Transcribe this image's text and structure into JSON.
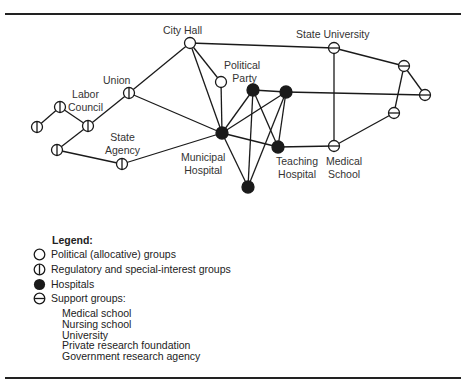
{
  "figure": {
    "nodes": [
      {
        "id": "city_hall",
        "label": "City Hall",
        "type": "political",
        "x": 190,
        "y": 43
      },
      {
        "id": "political_party",
        "label": "Political Party",
        "type": "political",
        "x": 221,
        "y": 82
      },
      {
        "id": "union",
        "label": "Union",
        "type": "regulatory",
        "x": 129,
        "y": 93
      },
      {
        "id": "labor_council",
        "label": "Labor Council",
        "type": "regulatory",
        "x": 60,
        "y": 107
      },
      {
        "id": "reg_left",
        "label": "",
        "type": "regulatory",
        "x": 37,
        "y": 127
      },
      {
        "id": "reg_mid",
        "label": "",
        "type": "regulatory",
        "x": 88,
        "y": 126
      },
      {
        "id": "reg_low",
        "label": "",
        "type": "regulatory",
        "x": 57,
        "y": 150
      },
      {
        "id": "state_agency",
        "label": "State Agency",
        "type": "regulatory",
        "x": 122,
        "y": 164
      },
      {
        "id": "municipal_hospital",
        "label": "Municipal Hospital",
        "type": "hospital",
        "x": 222,
        "y": 133
      },
      {
        "id": "hosp_a",
        "label": "",
        "type": "hospital",
        "x": 253,
        "y": 90
      },
      {
        "id": "hosp_b",
        "label": "",
        "type": "hospital",
        "x": 286,
        "y": 92
      },
      {
        "id": "teaching_hospital",
        "label": "Teaching Hospital",
        "type": "hospital",
        "x": 278,
        "y": 147
      },
      {
        "id": "hosp_bottom",
        "label": "",
        "type": "hospital",
        "x": 248,
        "y": 187
      },
      {
        "id": "state_university",
        "label": "State University",
        "type": "support",
        "x": 334,
        "y": 48
      },
      {
        "id": "medical_school",
        "label": "Medical School",
        "type": "support",
        "x": 334,
        "y": 146
      },
      {
        "id": "sup_upper_right",
        "label": "",
        "type": "support",
        "x": 404,
        "y": 66
      },
      {
        "id": "sup_far_right",
        "label": "",
        "type": "support",
        "x": 425,
        "y": 95
      },
      {
        "id": "sup_lower_right",
        "label": "",
        "type": "support",
        "x": 394,
        "y": 113
      }
    ],
    "edges": [
      [
        "reg_left",
        "labor_council"
      ],
      [
        "labor_council",
        "reg_mid"
      ],
      [
        "reg_mid",
        "union"
      ],
      [
        "reg_mid",
        "reg_low"
      ],
      [
        "reg_low",
        "state_agency"
      ],
      [
        "state_agency",
        "municipal_hospital"
      ],
      [
        "union",
        "city_hall"
      ],
      [
        "union",
        "municipal_hospital"
      ],
      [
        "city_hall",
        "political_party"
      ],
      [
        "city_hall",
        "municipal_hospital"
      ],
      [
        "city_hall",
        "state_university"
      ],
      [
        "political_party",
        "municipal_hospital"
      ],
      [
        "municipal_hospital",
        "hosp_a"
      ],
      [
        "municipal_hospital",
        "hosp_b"
      ],
      [
        "municipal_hospital",
        "teaching_hospital"
      ],
      [
        "municipal_hospital",
        "hosp_bottom"
      ],
      [
        "hosp_a",
        "hosp_b"
      ],
      [
        "hosp_a",
        "teaching_hospital"
      ],
      [
        "hosp_a",
        "hosp_bottom"
      ],
      [
        "hosp_b",
        "teaching_hospital"
      ],
      [
        "hosp_b",
        "hosp_bottom"
      ],
      [
        "hosp_b",
        "sup_far_right"
      ],
      [
        "teaching_hospital",
        "medical_school"
      ],
      [
        "state_university",
        "medical_school"
      ],
      [
        "state_university",
        "sup_upper_right"
      ],
      [
        "sup_upper_right",
        "sup_far_right"
      ],
      [
        "sup_upper_right",
        "sup_lower_right"
      ],
      [
        "sup_lower_right",
        "medical_school"
      ]
    ],
    "labels": {
      "city_hall": "City Hall",
      "political_1": "Political",
      "political_2": "Party",
      "union": "Union",
      "labor_1": "Labor",
      "labor_2": "Council",
      "state_agency_1": "State",
      "state_agency_2": "Agency",
      "municipal_1": "Municipal",
      "municipal_2": "Hospital",
      "teaching_1": "Teaching",
      "teaching_2": "Hospital",
      "medical_1": "Medical",
      "medical_2": "School",
      "state_university": "State University"
    }
  },
  "legend": {
    "title": "Legend:",
    "items": [
      {
        "symbol": "open-circle",
        "label": "Political (allocative) groups"
      },
      {
        "symbol": "vertical-bar-circle",
        "label": "Regulatory and special-interest groups"
      },
      {
        "symbol": "filled-circle",
        "label": "Hospitals"
      },
      {
        "symbol": "horizontal-bar-circle",
        "label": "Support groups:"
      }
    ],
    "support_subitems": [
      "Medical school",
      "Nursing school",
      "University",
      "Private research foundation",
      "Government research agency"
    ]
  }
}
